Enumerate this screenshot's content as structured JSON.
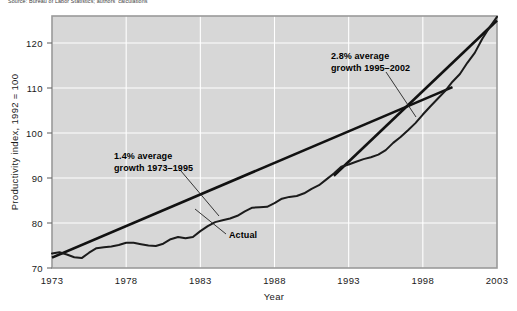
{
  "source_note": "Source: Bureau of Labor Statistics; authors' calculations",
  "chart_data": {
    "type": "line",
    "title": "",
    "xlabel": "Year",
    "ylabel": "Productivity index, 1992 = 100",
    "xlim": [
      1973,
      2003
    ],
    "ylim": [
      70,
      126
    ],
    "xticks": [
      1973,
      1978,
      1983,
      1988,
      1993,
      1998,
      2003
    ],
    "yticks": [
      70,
      80,
      90,
      100,
      110,
      120
    ],
    "grid": true,
    "legend_position": "none",
    "series": [
      {
        "name": "Actual",
        "kind": "actual",
        "x": [
          1973,
          1973.5,
          1974,
          1974.5,
          1975,
          1975.5,
          1976,
          1976.5,
          1977,
          1977.5,
          1978,
          1978.5,
          1979,
          1979.5,
          1980,
          1980.5,
          1981,
          1981.5,
          1982,
          1982.5,
          1983,
          1983.5,
          1984,
          1984.5,
          1985,
          1985.5,
          1986,
          1986.5,
          1987,
          1987.5,
          1988,
          1988.5,
          1989,
          1989.5,
          1990,
          1990.5,
          1991,
          1991.5,
          1992,
          1992.5,
          1993,
          1993.5,
          1994,
          1994.5,
          1995,
          1995.5,
          1996,
          1996.5,
          1997,
          1997.5,
          1998,
          1998.5,
          1999,
          1999.5,
          2000,
          2000.5,
          2001,
          2001.5,
          2002,
          2002.5,
          2003
        ],
        "y": [
          73.2,
          73.5,
          73.0,
          72.4,
          72.2,
          73.4,
          74.4,
          74.6,
          74.8,
          75.1,
          75.6,
          75.6,
          75.3,
          75.0,
          74.9,
          75.4,
          76.4,
          76.9,
          76.6,
          76.9,
          78.2,
          79.3,
          80.2,
          80.6,
          81.0,
          81.6,
          82.6,
          83.4,
          83.5,
          83.6,
          84.4,
          85.4,
          85.8,
          86.0,
          86.6,
          87.6,
          88.4,
          89.7,
          91.0,
          92.5,
          93.0,
          93.6,
          94.2,
          94.6,
          95.2,
          96.2,
          97.8,
          99.1,
          100.6,
          102.2,
          104.1,
          105.9,
          107.6,
          109.3,
          111.4,
          113.1,
          115.6,
          117.8,
          120.9,
          123.5,
          125.8
        ]
      },
      {
        "name": "1.4% average growth trend 1973-1995",
        "kind": "trend",
        "x": [
          1973,
          2000
        ],
        "y": [
          72.3,
          110.2
        ]
      },
      {
        "name": "2.8% average growth trend 1995-2002",
        "kind": "trend",
        "x": [
          1992,
          2003
        ],
        "y": [
          90.5,
          125.0
        ]
      }
    ],
    "annotations": [
      {
        "id": "growth-1973-1995",
        "line1": "1.4% average",
        "line2": "growth 1973–1995",
        "text_x": 114,
        "text_y": 159,
        "leader": [
          [
            181,
            171
          ],
          [
            219,
            216
          ]
        ]
      },
      {
        "id": "growth-1995-2002",
        "line1": "2.8% average",
        "line2": "growth 1995–2002",
        "text_x": 331,
        "text_y": 59,
        "leader": [
          [
            386,
            72
          ],
          [
            416,
            117
          ]
        ]
      },
      {
        "id": "actual-label",
        "line1": "Actual",
        "line2": "",
        "text_x": 229,
        "text_y": 238,
        "leader": [
          [
            226,
            234
          ],
          [
            195,
            209
          ]
        ]
      }
    ]
  }
}
